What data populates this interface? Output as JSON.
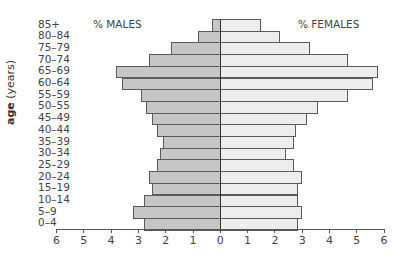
{
  "chart_data": {
    "type": "bar",
    "orientation": "horizontal",
    "subtype": "population-pyramid",
    "title": "",
    "ylabel": "age (years)",
    "ylabel_bold_part": "age",
    "ylabel_rest": " (years)",
    "left_label": "% MALES",
    "right_label": "% FEMALES",
    "xlim": [
      -6,
      6
    ],
    "x_ticks": [
      "6",
      "5",
      "4",
      "3",
      "2",
      "1",
      "0",
      "1",
      "2",
      "3",
      "4",
      "5",
      "6"
    ],
    "grid": false,
    "categories": [
      "85+",
      "80–84",
      "75–79",
      "70–74",
      "65–69",
      "60–64",
      "55–59",
      "50–55",
      "45–49",
      "40–44",
      "35–39",
      "30–34",
      "25–29",
      "20–24",
      "15–19",
      "10–14",
      "5–9",
      "0–4"
    ],
    "series": [
      {
        "name": "% MALES",
        "color": "#c6c6c6",
        "values": [
          0.3,
          0.8,
          1.8,
          2.6,
          3.8,
          3.6,
          2.9,
          2.7,
          2.5,
          2.3,
          2.1,
          2.2,
          2.3,
          2.6,
          2.5,
          2.8,
          3.2,
          2.8
        ]
      },
      {
        "name": "% FEMALES",
        "color": "#ededed",
        "values": [
          1.5,
          2.2,
          3.3,
          4.7,
          5.8,
          5.6,
          4.7,
          3.6,
          3.2,
          2.8,
          2.7,
          2.4,
          2.7,
          3.0,
          2.85,
          2.85,
          3.0,
          2.85
        ]
      }
    ]
  }
}
